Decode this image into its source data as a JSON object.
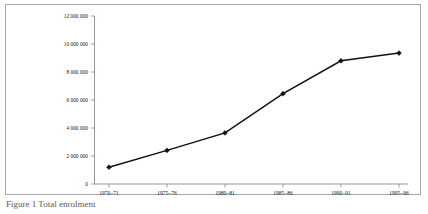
{
  "figure": {
    "caption": "Figure 1   Total enrolment",
    "border_color": "#a8a8a8",
    "background": "#ffffff"
  },
  "chart_data": {
    "type": "line",
    "title": "",
    "subtitle": "",
    "xlabel": "",
    "ylabel": "",
    "categories": [
      "1970–71",
      "1975–76",
      "1980–81",
      "1985–86",
      "1990–91",
      "1995–96"
    ],
    "values": [
      1200000,
      2400000,
      3650000,
      6450000,
      8800000,
      9350000
    ],
    "series": [
      {
        "name": "Enrolment",
        "values": [
          1200000,
          2400000,
          3650000,
          6450000,
          8800000,
          9350000
        ]
      }
    ],
    "ylim": [
      0,
      12000000
    ],
    "ytick_values": [
      0,
      2000000,
      4000000,
      6000000,
      8000000,
      10000000,
      12000000
    ],
    "ytick_labels": [
      "0",
      "2 000 000",
      "4 000 000",
      "6 000 000",
      "8 000 000",
      "10 000 000",
      "12 000 000"
    ],
    "xtick_labels": [
      "1970–71",
      "1975–76",
      "1980–81",
      "1985–86",
      "1990–91",
      "1995–96"
    ],
    "grid": false,
    "legend": false,
    "legend_position": "none",
    "marker": "filled-diamond",
    "line_color": "#111111",
    "marker_color": "#111111",
    "axis_color": "#8c8c8c",
    "annotations": []
  }
}
